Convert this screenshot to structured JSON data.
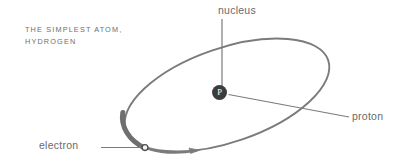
{
  "figure": {
    "domain": "Diagram",
    "width": 408,
    "height": 167,
    "background_color": "#ffffff",
    "caption": {
      "line1": "THE SIMPLEST ATOM,",
      "line2": "HYDROGEN",
      "full_text": "THE SIMPLEST ATOM, HYDROGEN",
      "color": "#6d6d6d"
    },
    "labels": {
      "nucleus": "nucleus",
      "proton": "proton",
      "electron": "electron",
      "color": "#6a6a6a"
    },
    "nucleus": {
      "symbol": "P",
      "symbol_color": "#ffffff",
      "fill_color": "#3c3c3c",
      "center_x": 219,
      "center_y": 92,
      "radius": 7.5
    },
    "electron": {
      "center_x": 145,
      "center_y": 148,
      "radius": 2.8,
      "fill_color": "#f0f0f0",
      "stroke_color": "#4a4a4a"
    },
    "orbit": {
      "center_x": 227,
      "center_y": 95,
      "radius_x": 107,
      "radius_y": 47,
      "rotation_deg": -19,
      "stroke_color": "#7b7b7b",
      "stroke_width_thin": 1.9,
      "stroke_width_thick": 5.0
    },
    "motion_arrow": {
      "direction": "clockwise-right",
      "tip_x": 198,
      "tip_y": 151,
      "stroke_color": "#7b7b7b"
    },
    "leader_lines": {
      "nucleus_leader": "vertical line from nucleus label down to nucleus circle",
      "proton_leader": "diagonal line from nucleus circle down-right to proton label",
      "electron_leader": "horizontal line from electron label right to electron dot",
      "stroke_color": "#7b7b7b"
    }
  }
}
